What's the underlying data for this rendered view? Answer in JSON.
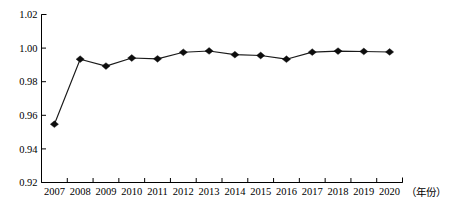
{
  "chart_data": {
    "type": "line",
    "title": "",
    "subtitle": "",
    "xlabel": "（年份）",
    "ylabel": "",
    "categories": [
      "2007",
      "2008",
      "2009",
      "2010",
      "2011",
      "2012",
      "2013",
      "2014",
      "2015",
      "2016",
      "2017",
      "2018",
      "2019",
      "2020"
    ],
    "values": [
      0.9547,
      0.9934,
      0.9893,
      0.9941,
      0.9936,
      0.9975,
      0.9983,
      0.9961,
      0.9956,
      0.9934,
      0.9976,
      0.9982,
      0.998,
      0.9977
    ],
    "series": [
      {
        "name": "series-1",
        "values": [
          0.9547,
          0.9934,
          0.9893,
          0.9941,
          0.9936,
          0.9975,
          0.9983,
          0.9961,
          0.9956,
          0.9934,
          0.9976,
          0.9982,
          0.998,
          0.9977
        ]
      }
    ],
    "ylim": [
      0.92,
      1.02
    ],
    "yticks": [
      0.92,
      0.94,
      0.96,
      0.98,
      1.0,
      1.02
    ],
    "ytick_labels": [
      "0.92",
      "0.94",
      "0.96",
      "0.98",
      "1.00",
      "1.02"
    ],
    "xtick_labels": [
      "2007",
      "2008",
      "2009",
      "2010",
      "2011",
      "2012",
      "2013",
      "2014",
      "2015",
      "2016",
      "2017",
      "2018",
      "2019",
      "2020"
    ],
    "grid": false,
    "legend": null,
    "legend_position": "none",
    "marker": "diamond",
    "line_color": "#1a1a1a",
    "marker_color": "#0d0d0d",
    "axis_color": "#000000",
    "background": "#ffffff",
    "annotations": []
  },
  "axis_name_label": "（年份）"
}
